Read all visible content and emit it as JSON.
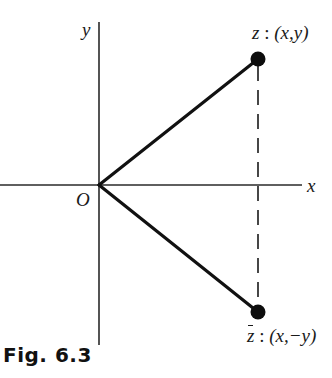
{
  "figure": {
    "caption": "Fig. 6.3",
    "axes": {
      "x_label": "x",
      "y_label": "y",
      "origin_label": "O"
    },
    "points": [
      {
        "name": "z",
        "label_name": "z",
        "label_sep": " : ",
        "label_coords": "(x,y)",
        "conjugate": false
      },
      {
        "name": "z-bar",
        "label_name": "z",
        "label_sep": " : ",
        "label_coords": "(x,−y)",
        "conjugate": true
      }
    ],
    "colors": {
      "ink": "#1a1a1a",
      "background": "#ffffff"
    }
  }
}
